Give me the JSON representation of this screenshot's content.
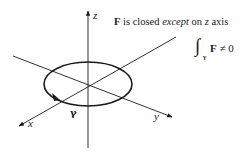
{
  "diagram": {
    "axes": {
      "x_label": "x",
      "y_label": "y",
      "z_label": "z"
    },
    "curve": {
      "label": "γ",
      "shape": "ellipse",
      "orientation": "counterclockwise-arrow"
    },
    "annotation": {
      "bold_F": "F",
      "text_part1": " is closed ",
      "text_italic": "except",
      "text_part2": " on ",
      "text_z": "z",
      "text_part3": " axis"
    },
    "integral": {
      "sign": "∫",
      "subscript": "γ",
      "integrand": "F",
      "relation": "≠ 0"
    },
    "colors": {
      "line": "#1a1a1a",
      "background": "#ffffff"
    }
  }
}
